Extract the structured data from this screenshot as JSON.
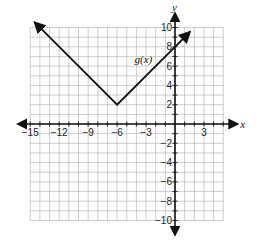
{
  "chart_data": {
    "type": "line",
    "title": "",
    "function_label": "g(x)",
    "xlabel": "x",
    "ylabel": "y",
    "xlim": [
      -15,
      5
    ],
    "ylim": [
      -10,
      10
    ],
    "grid": true,
    "grid_step": 1,
    "x_ticks": [
      -15,
      -12,
      -9,
      -6,
      -3,
      3
    ],
    "x_tick_labels": [
      "−15",
      "−12",
      "−9",
      "−6",
      "−3",
      "3"
    ],
    "y_ticks": [
      10,
      8,
      6,
      4,
      2,
      -2,
      -4,
      -6,
      -8,
      -10
    ],
    "y_tick_labels": [
      "10",
      "8",
      "6",
      "4",
      "2",
      "−2",
      "−4",
      "−6",
      "−8",
      "−10"
    ],
    "series": [
      {
        "name": "g(x)",
        "shape": "absolute value (V)",
        "vertex": [
          -6,
          2
        ],
        "points": [
          [
            -14.5,
            10.5
          ],
          [
            -6,
            2
          ],
          [
            1.5,
            9.5
          ]
        ],
        "y_intercept": 8,
        "arrows_at_ends": true
      }
    ],
    "colors": {
      "line": "#111111",
      "grid": "#b8b8b8",
      "axes": "#111111"
    }
  }
}
